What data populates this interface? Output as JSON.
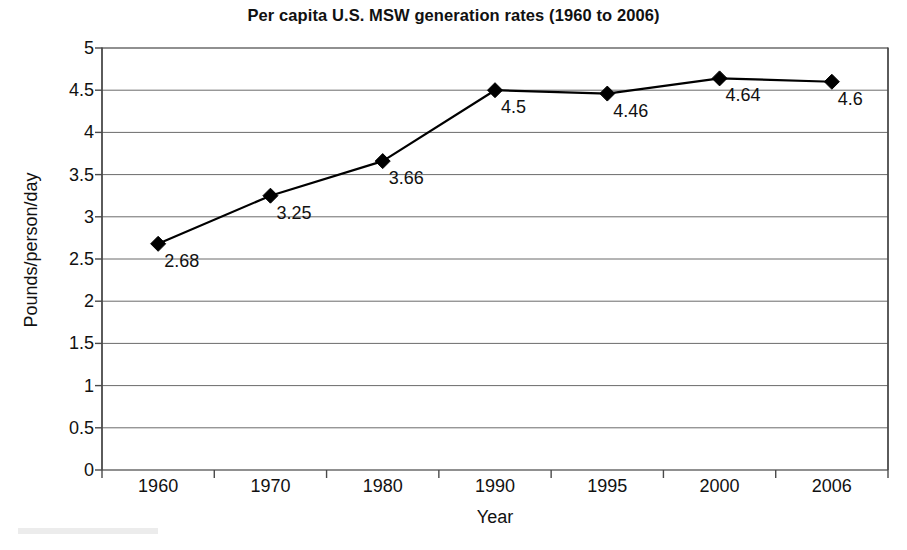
{
  "chart_data": {
    "type": "line",
    "title": "Per capita U.S. MSW generation rates (1960 to 2006)",
    "xlabel": "Year",
    "ylabel": "Pounds/person/day",
    "categories": [
      "1960",
      "1970",
      "1980",
      "1990",
      "1995",
      "2000",
      "2006"
    ],
    "values": [
      2.68,
      3.25,
      3.66,
      4.5,
      4.46,
      4.64,
      4.6
    ],
    "point_labels": [
      "2.68",
      "3.25",
      "3.66",
      "4.5",
      "4.46",
      "4.64",
      "4.6"
    ],
    "ylim": [
      0,
      5
    ],
    "ytick_labels": [
      "5",
      "4.5",
      "4",
      "3.5",
      "3",
      "2.5",
      "2",
      "1.5",
      "1",
      "0.5",
      "0"
    ],
    "ytick_values": [
      5,
      4.5,
      4,
      3.5,
      3,
      2.5,
      2,
      1.5,
      1,
      0.5,
      0
    ],
    "grid": "horizontal",
    "legend": "none",
    "marker": "diamond",
    "series_color": "#000000",
    "grid_color": "#6b6b6b",
    "axis_color": "#4a4a4a"
  }
}
